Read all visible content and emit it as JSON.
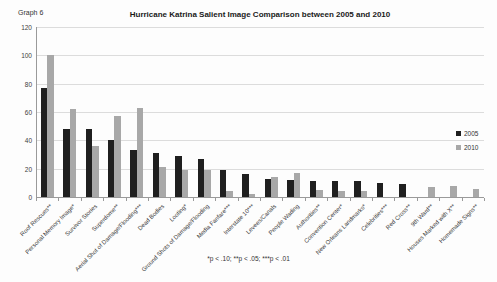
{
  "graph_label": "Graph 6",
  "footnote": "*p < .10; **p < .05; ***p < .01",
  "chart_data": {
    "type": "bar",
    "title": "Hurricane Katrina Salient Image Comparison between 2005 and 2010",
    "xlabel": "",
    "ylabel": "",
    "ylim": [
      0,
      120
    ],
    "ytick_step": 20,
    "grid": true,
    "legend_position": "right",
    "categories": [
      "Roof Rescues**",
      "Personal Memory Image*",
      "Survivor Stories",
      "Superdome**",
      "Aerial Shot of Damage/Flooding***",
      "Dead Bodies",
      "Looting*",
      "Ground Shots of Damage/Flooding",
      "Media Fanfare***",
      "Interstate 10***",
      "Levees/Canals",
      "People Wading",
      "Authorities**",
      "Convention Center*",
      "New Orleans Landmarks*",
      "Celebrities***",
      "Red Cross**",
      "9th Ward**",
      "Houses Marked with X**",
      "Homemade Signs**"
    ],
    "series": [
      {
        "name": "2005",
        "color": "#1f1f1f",
        "values": [
          77,
          48,
          48,
          40,
          33,
          31,
          29,
          27,
          19,
          16,
          13,
          12,
          11,
          11,
          11,
          10,
          9,
          0,
          0,
          0
        ]
      },
      {
        "name": "2010",
        "color": "#a8a8a8",
        "values": [
          100,
          62,
          36,
          57,
          63,
          21,
          19,
          19,
          4,
          2,
          14,
          17,
          5,
          4,
          4,
          0,
          0,
          7,
          8,
          6
        ]
      }
    ]
  }
}
